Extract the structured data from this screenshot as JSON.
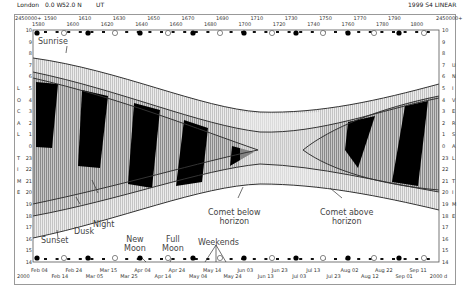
{
  "header": {
    "location": "London",
    "longitude": "0.0 W",
    "latitude": "52.0 N",
    "timezone": "UT",
    "mode": "1999 S4 LINEAR",
    "jd_prefix_left": "2450000+",
    "jd_prefix_right": "2450000+"
  },
  "top_axis": {
    "upper_labels": [
      "1590",
      "1610",
      "1630",
      "1650",
      "1670",
      "1690",
      "1710",
      "1730",
      "1750",
      "1770",
      "1790"
    ],
    "lower_labels": [
      "1580",
      "1600",
      "1620",
      "1640",
      "1660",
      "1680",
      "1700",
      "1720",
      "1740",
      "1760",
      "1780",
      "1800"
    ]
  },
  "bottom_axis": {
    "upper_labels": [
      "Feb 04",
      "Feb 24",
      "Mar 15",
      "Apr 04",
      "Apr 24",
      "May 14",
      "Jun 03",
      "Jun 23",
      "Jul 13",
      "Aug 02",
      "Aug 22",
      "Sep 11"
    ],
    "lower_labels": [
      "2000",
      "Feb 14",
      "Mar 05",
      "Mar 25",
      "Apr 14",
      "May 04",
      "May 24",
      "Jun 13",
      "Jul 03",
      "Jul 23",
      "Aug 12",
      "Sep 01",
      "2000 d"
    ]
  },
  "left_axis": {
    "hours": [
      "10",
      "9",
      "8",
      "7",
      "6",
      "5",
      "4",
      "3",
      "2",
      "1",
      "0",
      "23",
      "22",
      "21",
      "20",
      "19",
      "18",
      "17",
      "16",
      "15",
      "14"
    ],
    "title_letters": [
      "L",
      "O",
      "C",
      "A",
      "L",
      "T",
      "I",
      "M",
      "E"
    ]
  },
  "right_axis": {
    "hours": [
      "10",
      "9",
      "8",
      "7",
      "6",
      "5",
      "4",
      "3",
      "2",
      "1",
      "0",
      "23",
      "22",
      "21",
      "20",
      "19",
      "18",
      "17",
      "16",
      "15",
      "14"
    ],
    "title_letters": [
      "U",
      "N",
      "I",
      "V",
      "E",
      "R",
      "S",
      "A",
      "L",
      "T",
      "I",
      "M",
      "E"
    ]
  },
  "annotations": {
    "sunrise": "Sunrise",
    "sunset": "Sunset",
    "dusk": "Dusk",
    "night": "Night",
    "comet_below": "Comet below horizon",
    "comet_below_l1": "Comet below",
    "comet_below_l2": "horizon",
    "comet_above_l1": "Comet above",
    "comet_above_l2": "horizon",
    "new_moon_l1": "New",
    "new_moon_l2": "Moon",
    "full_moon_l1": "Full",
    "full_moon_l2": "Moon",
    "weekends": "Weekends"
  },
  "chart_data": {
    "type": "area",
    "xlabel": "Date (2000)",
    "ylabel": "Local Time / Universal Time (hours)",
    "x_range": [
      "2000-01-26",
      "2000-09-15"
    ],
    "y_range_hours": [
      10,
      14
    ],
    "y_direction": "top 10h descending through midnight to 14h at bottom",
    "grid": false,
    "series": [
      {
        "name": "Sunrise",
        "x": [
          "Feb 04",
          "Mar 15",
          "Apr 24",
          "Jun 03",
          "Jun 23",
          "Aug 02",
          "Sep 11"
        ],
        "hour": [
          7.6,
          6.2,
          5.0,
          3.9,
          3.8,
          4.4,
          5.4
        ]
      },
      {
        "name": "Sunset",
        "x": [
          "Feb 04",
          "Mar 15",
          "Apr 24",
          "Jun 03",
          "Jun 23",
          "Aug 02",
          "Sep 11"
        ],
        "hour": [
          16.8,
          18.0,
          19.8,
          20.9,
          21.2,
          20.6,
          19.2
        ]
      },
      {
        "name": "Night start (Dusk end)",
        "x": [
          "Feb 04",
          "Mar 15",
          "Apr 24",
          "Jun 03"
        ],
        "hour": [
          18.4,
          19.5,
          21.8,
          0.3
        ]
      },
      {
        "name": "Night end",
        "x": [
          "Feb 04",
          "Mar 15",
          "Apr 24",
          "Jun 03"
        ],
        "hour": [
          5.8,
          4.5,
          2.8,
          0.3
        ]
      }
    ],
    "moon_phases": {
      "new_moon": [
        "Feb 05",
        "Mar 06",
        "Apr 04",
        "May 04",
        "Jun 02",
        "Jul 01",
        "Jul 31",
        "Aug 29"
      ],
      "full_moon": [
        "Feb 19",
        "Mar 20",
        "Apr 18",
        "May 18",
        "Jun 16",
        "Jul 16",
        "Aug 15",
        "Sep 13"
      ]
    },
    "legend": [
      "Sunrise",
      "Sunset",
      "Dusk",
      "Night",
      "Comet below horizon",
      "Comet above horizon",
      "New Moon",
      "Full Moon",
      "Weekends"
    ]
  }
}
